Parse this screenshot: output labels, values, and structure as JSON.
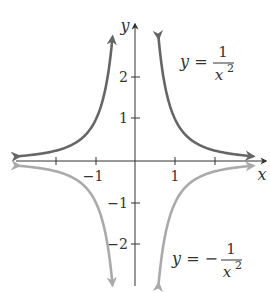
{
  "chart_data": {
    "type": "line",
    "title": "",
    "xlabel": "x",
    "ylabel": "y",
    "xlim": [
      -3,
      3
    ],
    "ylim": [
      -3,
      3
    ],
    "grid": false,
    "x_ticks": [
      -2,
      -1,
      1,
      2
    ],
    "x_tick_labels": [
      "",
      "−1",
      "1",
      ""
    ],
    "y_ticks": [
      -2,
      -1,
      1,
      2
    ],
    "y_tick_labels": [
      "−2",
      "−1",
      "1",
      "2"
    ],
    "series": [
      {
        "name": "y = 1/x^2",
        "label_text": {
          "lhs": "y =",
          "num": "1",
          "den": "x",
          "exp": "2"
        },
        "color": "#666666",
        "x": [
          -2.9,
          -2.5,
          -2,
          -1.5,
          -1.2,
          -1,
          -0.85,
          -0.75,
          -0.65,
          -0.58,
          0.58,
          0.65,
          0.75,
          0.85,
          1,
          1.2,
          1.5,
          2,
          2.5,
          2.9
        ],
        "y": [
          0.119,
          0.16,
          0.25,
          0.444,
          0.694,
          1,
          1.384,
          1.778,
          2.367,
          2.97,
          2.97,
          2.367,
          1.778,
          1.384,
          1,
          0.694,
          0.444,
          0.25,
          0.16,
          0.119
        ]
      },
      {
        "name": "y = -1/x^2",
        "label_text": {
          "lhs": "y = −",
          "num": "1",
          "den": "x",
          "exp": "2"
        },
        "color": "#aaaaaa",
        "x": [
          -2.9,
          -2.5,
          -2,
          -1.5,
          -1.2,
          -1,
          -0.85,
          -0.75,
          -0.65,
          -0.58,
          0.58,
          0.65,
          0.75,
          0.85,
          1,
          1.2,
          1.5,
          2,
          2.5,
          2.9
        ],
        "y": [
          -0.119,
          -0.16,
          -0.25,
          -0.444,
          -0.694,
          -1,
          -1.384,
          -1.778,
          -2.367,
          -2.97,
          -2.97,
          -2.367,
          -1.778,
          -1.384,
          -1,
          -0.694,
          -0.444,
          -0.25,
          -0.16,
          -0.119
        ]
      }
    ],
    "annotations": [
      {
        "text": "y = 1/x^2",
        "position": "upper right"
      },
      {
        "text": "y = -1/x^2",
        "position": "lower right"
      }
    ],
    "legend": "none"
  },
  "axes": {
    "x_label": "x",
    "y_label": "y"
  },
  "labels": {
    "upper": {
      "lhs": "y =",
      "num": "1",
      "den": "x",
      "exp": "2"
    },
    "lower": {
      "lhs": "y = −",
      "num": "1",
      "den": "x",
      "exp": "2"
    }
  },
  "ticks": {
    "x_neg1": "−1",
    "x_pos1": "1",
    "y_2": "2",
    "y_1": "1",
    "y_neg1": "−1",
    "y_neg2": "−2"
  }
}
